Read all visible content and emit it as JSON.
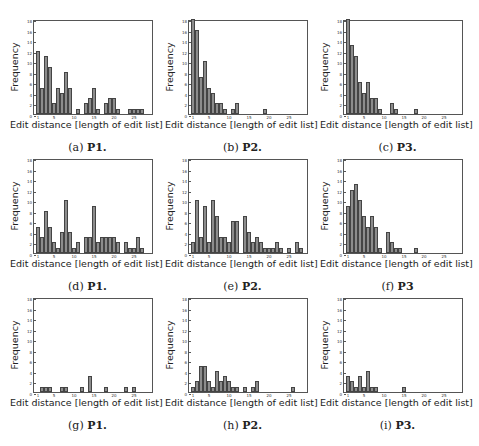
{
  "axis": {
    "xlabel": "Edit distance [length of edit list]",
    "ylabel": "Frequency",
    "xlim": [
      0,
      30
    ],
    "ylim": [
      0,
      18
    ],
    "xticks": [
      1,
      5,
      10,
      15,
      20,
      25
    ],
    "yticks": [
      0,
      2,
      4,
      6,
      8,
      10,
      12,
      14,
      16,
      18
    ]
  },
  "colors": {
    "bar_fill": "#8c8c8c",
    "bar_edge": "#444444",
    "axes": "#555555"
  },
  "captions": [
    {
      "letter": "(a)",
      "label": "P1."
    },
    {
      "letter": "(b)",
      "label": "P2."
    },
    {
      "letter": "(c)",
      "label": "P3."
    },
    {
      "letter": "(d)",
      "label": "P1."
    },
    {
      "letter": "(e)",
      "label": "P2."
    },
    {
      "letter": "(f)",
      "label": "P3"
    },
    {
      "letter": "(g)",
      "label": "P1."
    },
    {
      "letter": "(h)",
      "label": "P2."
    },
    {
      "letter": "(i)",
      "label": "P3."
    }
  ],
  "chart_data": [
    {
      "id": "a",
      "type": "bar",
      "title": "(a) P1.",
      "xlabel": "Edit distance [length of edit list]",
      "ylabel": "Frequency",
      "ylim": [
        0,
        18
      ],
      "x": [
        1,
        2,
        3,
        4,
        5,
        6,
        7,
        8,
        9,
        10,
        11,
        12,
        13,
        14,
        15,
        16,
        17,
        18,
        19,
        20,
        21,
        22,
        23,
        24,
        25,
        26,
        27
      ],
      "values": [
        12,
        5,
        11,
        9,
        2,
        5,
        4,
        8,
        5,
        0,
        1,
        0,
        2,
        3,
        5,
        1,
        0,
        2,
        3,
        3,
        1,
        0,
        0,
        1,
        1,
        1,
        1
      ]
    },
    {
      "id": "b",
      "type": "bar",
      "title": "(b) P2.",
      "xlabel": "Edit distance [length of edit list]",
      "ylabel": "Frequency",
      "ylim": [
        0,
        18
      ],
      "x": [
        1,
        2,
        3,
        4,
        5,
        6,
        7,
        8,
        9,
        10,
        11,
        12,
        13,
        14,
        15,
        16,
        17,
        18,
        19
      ],
      "values": [
        18,
        16,
        7,
        10,
        5,
        4,
        2,
        2,
        1,
        0,
        1,
        2,
        0,
        0,
        0,
        0,
        0,
        0,
        1
      ]
    },
    {
      "id": "c",
      "type": "bar",
      "title": "(c) P3.",
      "xlabel": "Edit distance [length of edit list]",
      "ylabel": "Frequency",
      "ylim": [
        0,
        18
      ],
      "x": [
        1,
        2,
        3,
        4,
        5,
        6,
        7,
        8,
        9,
        10,
        11,
        12,
        13,
        14,
        15,
        16,
        17,
        18
      ],
      "values": [
        18,
        13,
        11,
        6,
        4,
        6,
        3,
        3,
        1,
        0,
        0,
        2,
        1,
        0,
        0,
        0,
        0,
        1
      ]
    },
    {
      "id": "d",
      "type": "bar",
      "title": "(d) P1.",
      "xlabel": "Edit distance [length of edit list]",
      "ylabel": "Frequency",
      "ylim": [
        0,
        18
      ],
      "x": [
        1,
        2,
        3,
        4,
        5,
        6,
        7,
        8,
        9,
        10,
        11,
        12,
        13,
        14,
        15,
        16,
        17,
        18,
        19,
        20,
        21,
        22,
        23,
        24,
        25,
        26,
        27
      ],
      "values": [
        5,
        3,
        8,
        5,
        2,
        1,
        4,
        10,
        4,
        1,
        2,
        0,
        3,
        3,
        9,
        2,
        3,
        3,
        3,
        3,
        2,
        0,
        2,
        1,
        1,
        3,
        1
      ]
    },
    {
      "id": "e",
      "type": "bar",
      "title": "(e) P2.",
      "xlabel": "Edit distance [length of edit list]",
      "ylabel": "Frequency",
      "ylim": [
        0,
        18
      ],
      "x": [
        1,
        2,
        3,
        4,
        5,
        6,
        7,
        8,
        9,
        10,
        11,
        12,
        13,
        14,
        15,
        16,
        17,
        18,
        19,
        20,
        21,
        22,
        23,
        24,
        25,
        26,
        27,
        28
      ],
      "values": [
        2,
        10,
        3,
        9,
        2,
        10,
        7,
        3,
        3,
        2,
        6,
        6,
        0,
        7,
        4,
        2,
        3,
        2,
        1,
        1,
        1,
        2,
        1,
        0,
        1,
        0,
        2,
        1
      ]
    },
    {
      "id": "f",
      "type": "bar",
      "title": "(f) P3",
      "xlabel": "Edit distance [length of edit list]",
      "ylabel": "Frequency",
      "ylim": [
        0,
        18
      ],
      "x": [
        1,
        2,
        3,
        4,
        5,
        6,
        7,
        8,
        9,
        10,
        11,
        12,
        13,
        14,
        15,
        16,
        17,
        18
      ],
      "values": [
        9,
        12,
        13,
        10,
        7,
        5,
        7,
        5,
        1,
        0,
        4,
        2,
        1,
        1,
        0,
        0,
        0,
        1
      ]
    },
    {
      "id": "g",
      "type": "bar",
      "title": "(g) P1.",
      "xlabel": "Edit distance [length of edit list]",
      "ylabel": "Frequency",
      "ylim": [
        0,
        18
      ],
      "x": [
        1,
        2,
        3,
        4,
        5,
        6,
        7,
        8,
        9,
        10,
        11,
        12,
        13,
        14,
        15,
        16,
        17,
        18,
        19,
        20,
        21,
        22,
        23,
        24,
        25
      ],
      "values": [
        0,
        1,
        1,
        1,
        0,
        0,
        1,
        1,
        0,
        0,
        0,
        1,
        0,
        3,
        0,
        0,
        0,
        1,
        0,
        0,
        0,
        0,
        1,
        0,
        1
      ]
    },
    {
      "id": "h",
      "type": "bar",
      "title": "(h) P2.",
      "xlabel": "Edit distance [length of edit list]",
      "ylabel": "Frequency",
      "ylim": [
        0,
        18
      ],
      "x": [
        1,
        2,
        3,
        4,
        5,
        6,
        7,
        8,
        9,
        10,
        11,
        12,
        13,
        14,
        15,
        16,
        17,
        18,
        19,
        20,
        21,
        22,
        23,
        24,
        25,
        26
      ],
      "values": [
        1,
        2,
        5,
        5,
        2,
        1,
        4,
        2,
        3,
        2,
        1,
        1,
        0,
        1,
        0,
        1,
        2,
        0,
        0,
        0,
        0,
        0,
        0,
        0,
        0,
        1
      ]
    },
    {
      "id": "i",
      "type": "bar",
      "title": "(i) P3.",
      "xlabel": "Edit distance [length of edit list]",
      "ylabel": "Frequency",
      "ylim": [
        0,
        18
      ],
      "x": [
        1,
        2,
        3,
        4,
        5,
        6,
        7,
        8,
        9,
        10,
        11,
        12,
        13,
        14,
        15
      ],
      "values": [
        3,
        2,
        1,
        3,
        1,
        4,
        1,
        1,
        0,
        0,
        0,
        0,
        0,
        0,
        1
      ]
    }
  ]
}
